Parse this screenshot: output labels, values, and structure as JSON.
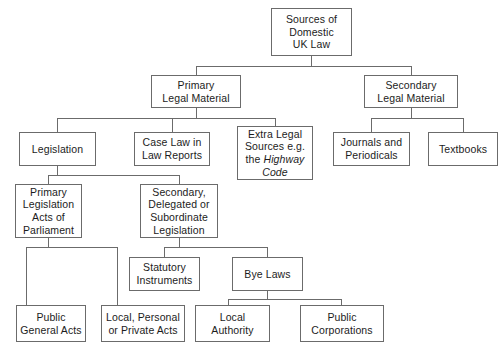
{
  "diagram": {
    "type": "hierarchy-tree",
    "stroke_color": "#6b6b6b",
    "text_color": "#1c1c1c",
    "background_color": "#ffffff",
    "nodes": [
      {
        "id": "root",
        "label": "Sources of\nDomestic\nUK Law",
        "level": 0
      },
      {
        "id": "primary",
        "label": "Primary\nLegal Material",
        "level": 1
      },
      {
        "id": "secondary",
        "label": "Secondary\nLegal Material",
        "level": 1
      },
      {
        "id": "legislation",
        "label": "Legislation",
        "level": 2
      },
      {
        "id": "caselaw",
        "label": "Case Law in\nLaw Reports",
        "level": 2
      },
      {
        "id": "extralegal",
        "label": "Extra Legal\nSources e.g.\nthe Highway\nCode",
        "level": 2,
        "italic_part": "Highway Code"
      },
      {
        "id": "journals",
        "label": "Journals and\nPeriodicals",
        "level": 2
      },
      {
        "id": "textbooks",
        "label": "Textbooks",
        "level": 2
      },
      {
        "id": "primleg",
        "label": "Primary\nLegislation\nActs of\nParliament",
        "level": 3
      },
      {
        "id": "secleg",
        "label": "Secondary,\nDelegated or\nSubordinate\nLegislation",
        "level": 3
      },
      {
        "id": "statinst",
        "label": "Statutory\nInstruments",
        "level": 4
      },
      {
        "id": "byelaws",
        "label": "Bye Laws",
        "level": 4
      },
      {
        "id": "publicgen",
        "label": "Public\nGeneral Acts",
        "level": 5
      },
      {
        "id": "localpers",
        "label": "Local, Personal\nor Private Acts",
        "level": 5
      },
      {
        "id": "localauth",
        "label": "Local\nAuthority",
        "level": 5
      },
      {
        "id": "publiccorp",
        "label": "Public\nCorporations",
        "level": 5
      }
    ],
    "edges": [
      {
        "from": "root",
        "to": "primary"
      },
      {
        "from": "root",
        "to": "secondary"
      },
      {
        "from": "primary",
        "to": "legislation"
      },
      {
        "from": "primary",
        "to": "caselaw"
      },
      {
        "from": "primary",
        "to": "extralegal"
      },
      {
        "from": "secondary",
        "to": "journals"
      },
      {
        "from": "secondary",
        "to": "textbooks"
      },
      {
        "from": "legislation",
        "to": "primleg"
      },
      {
        "from": "legislation",
        "to": "secleg"
      },
      {
        "from": "primleg",
        "to": "publicgen"
      },
      {
        "from": "primleg",
        "to": "localpers"
      },
      {
        "from": "secleg",
        "to": "statinst"
      },
      {
        "from": "secleg",
        "to": "byelaws"
      },
      {
        "from": "byelaws",
        "to": "localauth"
      },
      {
        "from": "byelaws",
        "to": "publiccorp"
      }
    ]
  }
}
